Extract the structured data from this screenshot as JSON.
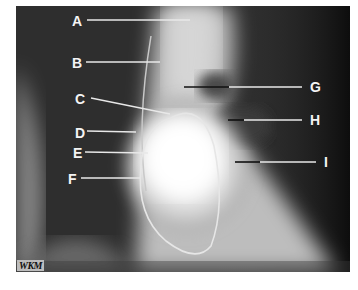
{
  "figure": {
    "type": "annotated chest radiograph",
    "watermark": "WKM",
    "labels": [
      {
        "id": "A",
        "text": "A",
        "side": "left"
      },
      {
        "id": "B",
        "text": "B",
        "side": "left"
      },
      {
        "id": "C",
        "text": "C",
        "side": "left"
      },
      {
        "id": "D",
        "text": "D",
        "side": "left"
      },
      {
        "id": "E",
        "text": "E",
        "side": "left"
      },
      {
        "id": "F",
        "text": "F",
        "side": "left"
      },
      {
        "id": "G",
        "text": "G",
        "side": "right"
      },
      {
        "id": "H",
        "text": "H",
        "side": "right"
      },
      {
        "id": "I",
        "text": "I",
        "side": "right"
      }
    ],
    "colors": {
      "background": "#2a2a2a",
      "bright": "#ffffff",
      "label_text": "#f4f4f4",
      "pointer_white": "#e8e8e8",
      "pointer_black": "#111111"
    }
  }
}
